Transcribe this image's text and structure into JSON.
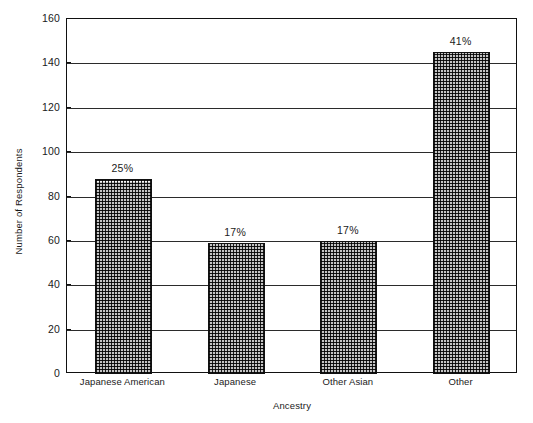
{
  "chart_data": {
    "type": "bar",
    "title": "",
    "xlabel": "Ancestry",
    "ylabel": "Number of Respondents",
    "categories": [
      "Japanese American",
      "Japanese",
      "Other Asian",
      "Other"
    ],
    "values": [
      88,
      59,
      60,
      145
    ],
    "data_labels": [
      "25%",
      "17%",
      "17%",
      "41%"
    ],
    "ylim": [
      0,
      160
    ],
    "ytick_step": 20,
    "yticks": [
      0,
      20,
      40,
      60,
      80,
      100,
      120,
      140,
      160
    ],
    "ytick_labels": [
      "0",
      "20",
      "40",
      "60",
      "80",
      "100",
      "120",
      "140",
      "160"
    ],
    "grid": true,
    "legend": false,
    "legend_position": "none",
    "bar_fill": "#8f8f8f",
    "bar_pattern": "crosshatch",
    "bar_border_color": "#111111",
    "axis_color": "#111111",
    "background": "#ffffff"
  },
  "axes": {
    "y_title": "Number of Respondents",
    "x_title": "Ancestry"
  }
}
